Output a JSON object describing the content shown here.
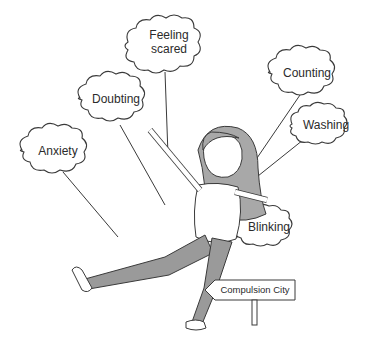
{
  "illustration": {
    "description": "Cartoon girl as a puppet, strings held by thought clouds, walking toward a sign",
    "clouds": [
      {
        "id": "feeling-scared",
        "label_line1": "Feeling",
        "label_line2": "scared"
      },
      {
        "id": "doubting",
        "label": "Doubting"
      },
      {
        "id": "anxiety",
        "label": "Anxiety"
      },
      {
        "id": "counting",
        "label": "Counting"
      },
      {
        "id": "washing",
        "label": "Washing"
      },
      {
        "id": "blinking",
        "label": "Blinking"
      }
    ],
    "sign": {
      "label": "Compulsion City",
      "direction": "left"
    },
    "colors": {
      "line": "#3a3a3a",
      "fill_grey": "#9a9a9a",
      "hair": "#a8a8a8",
      "background": "#ffffff"
    }
  }
}
